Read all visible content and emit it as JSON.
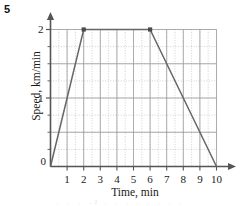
{
  "question_number": "5",
  "page_bleed_text": "·   ·  ·  ·²  ·   ·   ·   ·   ·   ·  ·  ·",
  "colors": {
    "axis": "#555555",
    "line": "#666666",
    "grid_major": "#9a9a9a",
    "grid_minor": "#bdbdbd",
    "marker": "#4a4a4a",
    "text": "#1a1a1a"
  },
  "chart_data": {
    "type": "line",
    "title": "",
    "xlabel": "Time, min",
    "ylabel": "Speed, km/min",
    "xlim": [
      0,
      10
    ],
    "ylim": [
      0,
      2
    ],
    "grid": true,
    "grid_major_x_step": 1,
    "grid_major_y_step": 0.5,
    "grid_minor_x_step": 0.5,
    "grid_minor_y_step": 0.25,
    "legend": "none",
    "x_tick_labels": [
      "1",
      "2",
      "3",
      "4",
      "5",
      "6",
      "7",
      "8",
      "9",
      "10"
    ],
    "x_tick_values": [
      1,
      2,
      3,
      4,
      5,
      6,
      7,
      8,
      9,
      10
    ],
    "y_tick_labels": [
      "1",
      "2"
    ],
    "y_tick_values": [
      1,
      2
    ],
    "y_minor_tick_values": [
      0.25,
      0.5,
      0.75,
      1.25,
      1.5,
      1.75
    ],
    "origin_label": "0",
    "axis_arrows": [
      "x-right",
      "y-up"
    ],
    "series": [
      {
        "name": "speed",
        "x": [
          0,
          2,
          6,
          10
        ],
        "y": [
          0,
          2,
          2,
          0
        ],
        "marker_points": [
          {
            "x": 2,
            "y": 2
          },
          {
            "x": 6,
            "y": 2
          }
        ]
      }
    ]
  }
}
